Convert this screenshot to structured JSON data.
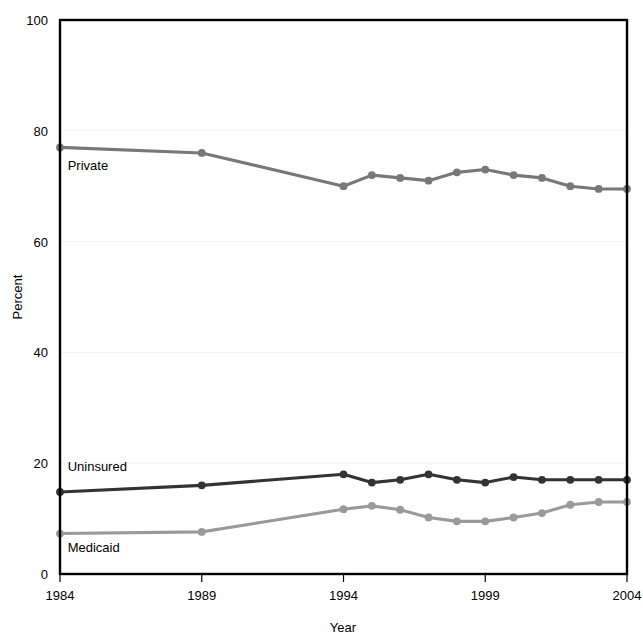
{
  "chart_data": {
    "type": "line",
    "title": "",
    "subtitle": "",
    "xlabel": "Year",
    "ylabel": "Percent",
    "xlim": [
      1984,
      2004
    ],
    "ylim": [
      0,
      100
    ],
    "x_ticks": [
      1984,
      1989,
      1994,
      1999,
      2004
    ],
    "x_tick_labels": [
      "1984",
      "1989",
      "1994",
      "1999",
      "2004"
    ],
    "y_ticks": [
      0,
      20,
      40,
      60,
      80,
      100
    ],
    "y_tick_labels": [
      "0",
      "20",
      "40",
      "60",
      "80",
      "100"
    ],
    "grid": "horizontal",
    "legend_position": "inline-labels",
    "x": [
      1984,
      1989,
      1994,
      1995,
      1996,
      1997,
      1998,
      1999,
      2000,
      2001,
      2002,
      2003,
      2004
    ],
    "series": [
      {
        "name": "Private",
        "label": "Private",
        "color": "#787878",
        "label_x": 1984.2,
        "label_y": 73.0,
        "values": [
          77.0,
          76.0,
          70.0,
          72.0,
          71.5,
          71.0,
          72.5,
          73.0,
          72.0,
          71.5,
          70.0,
          69.5,
          69.5
        ]
      },
      {
        "name": "Uninsured",
        "label": "Uninsured",
        "color": "#333333",
        "label_x": 1984.2,
        "label_y": 18.6,
        "values": [
          14.8,
          16.0,
          18.0,
          16.5,
          17.0,
          18.0,
          17.0,
          16.5,
          17.5,
          17.0,
          17.0,
          17.0,
          17.0
        ]
      },
      {
        "name": "Medicaid",
        "label": "Medicaid",
        "color": "#9a9a9a",
        "label_x": 1984.2,
        "label_y": 4.0,
        "values": [
          7.3,
          7.6,
          11.7,
          12.3,
          11.6,
          10.2,
          9.5,
          9.5,
          10.2,
          11.0,
          12.5,
          13.0,
          13.0
        ]
      }
    ]
  },
  "axes": {
    "x_axis_title": "Year",
    "y_axis_title": "Percent"
  }
}
